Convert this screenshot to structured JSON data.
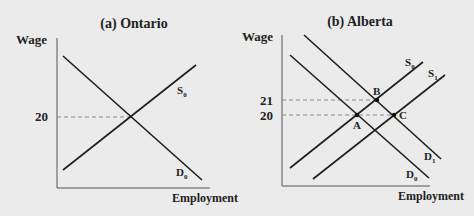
{
  "panels": [
    {
      "title": "(a) Ontario",
      "y_label": "Wage",
      "x_label": "Employment",
      "y_ticks": [
        "20"
      ],
      "curves": {
        "supply": [
          "S",
          "0"
        ],
        "demand": [
          "D",
          "0"
        ]
      }
    },
    {
      "title": "(b) Alberta",
      "y_label": "Wage",
      "x_label": "Employment",
      "y_ticks": [
        "21",
        "20"
      ],
      "curves": {
        "supply0": [
          "S",
          "0"
        ],
        "supply1": [
          "S",
          "1"
        ],
        "demand0": [
          "D",
          "0"
        ],
        "demand1": [
          "D",
          "1"
        ]
      },
      "points": [
        "A",
        "B",
        "C"
      ]
    }
  ],
  "colors": {
    "background": "#ebebeb",
    "line": "#1e1e1e",
    "dashed": "#8a8a8a"
  }
}
